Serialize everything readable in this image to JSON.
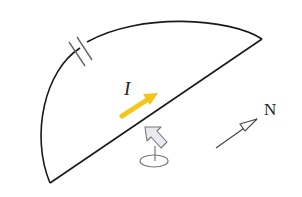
{
  "diagram": {
    "type": "physics-circuit-diagram",
    "labels": {
      "current": "I",
      "north": "N"
    },
    "colors": {
      "wire": "#1a1a1a",
      "current_arrow": "#f5c518",
      "compass_needle_fill": "#e8eaf0",
      "compass_needle_stroke": "#777777",
      "north_arrow": "#444444",
      "background": "#ffffff"
    },
    "elements": [
      {
        "name": "semicircle-wire-loop",
        "shape": "arc + straight chord"
      },
      {
        "name": "gap-break",
        "shape": "two parallel short lines across the arc"
      },
      {
        "name": "current-arrow",
        "label": "I",
        "color": "yellow"
      },
      {
        "name": "compass-needle",
        "shape": "pivoted arrow on an ellipse base"
      },
      {
        "name": "north-indicator",
        "label": "N"
      }
    ]
  }
}
